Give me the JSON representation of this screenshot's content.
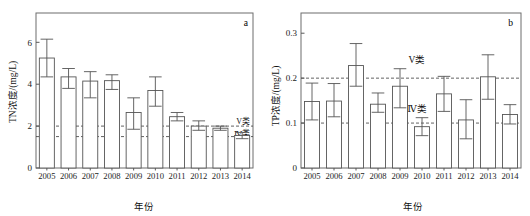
{
  "figure": {
    "panel_a_letter": "a",
    "panel_b_letter": "b"
  },
  "chart_data": [
    {
      "type": "bar",
      "panel": "a",
      "title": "",
      "xlabel": "年份",
      "ylabel": "TN浓度/(mg/L)",
      "categories": [
        "2005",
        "2006",
        "2007",
        "2008",
        "2009",
        "2010",
        "2011",
        "2012",
        "2013",
        "2014"
      ],
      "values": [
        5.25,
        4.35,
        4.15,
        4.17,
        2.65,
        3.7,
        2.45,
        2.0,
        1.9,
        1.55
      ],
      "error_low": [
        4.35,
        3.8,
        3.35,
        3.75,
        1.85,
        2.95,
        2.25,
        1.8,
        1.8,
        1.4
      ],
      "error_high": [
        6.15,
        4.75,
        4.6,
        4.45,
        3.35,
        4.35,
        2.65,
        2.25,
        2.0,
        1.7
      ],
      "ylim": [
        0,
        7.4
      ],
      "yticks": [
        0,
        2,
        4,
        6
      ],
      "ytick_labels": [
        "0",
        "2",
        "4",
        "6"
      ],
      "grid": false,
      "reference_lines": [
        {
          "label": "V类",
          "value": 2.0
        },
        {
          "label": "Ⅳ类",
          "value": 1.5
        }
      ]
    },
    {
      "type": "bar",
      "panel": "b",
      "title": "",
      "xlabel": "年份",
      "ylabel": "TP浓度/(mg/L)",
      "categories": [
        "2005",
        "2006",
        "2007",
        "2008",
        "2009",
        "2010",
        "2011",
        "2012",
        "2013",
        "2014"
      ],
      "values": [
        0.148,
        0.149,
        0.228,
        0.142,
        0.182,
        0.092,
        0.165,
        0.107,
        0.203,
        0.119
      ],
      "error_low": [
        0.107,
        0.114,
        0.182,
        0.124,
        0.134,
        0.072,
        0.126,
        0.065,
        0.153,
        0.098
      ],
      "error_high": [
        0.189,
        0.188,
        0.277,
        0.167,
        0.221,
        0.112,
        0.204,
        0.152,
        0.252,
        0.141
      ],
      "ylim": [
        0,
        0.345
      ],
      "yticks": [
        0,
        0.1,
        0.2,
        0.3
      ],
      "ytick_labels": [
        "0",
        "0.1",
        "0.2",
        "0.3"
      ],
      "grid": false,
      "reference_lines": [
        {
          "label": "V类",
          "value": 0.2
        },
        {
          "label": "Ⅳ类",
          "value": 0.1
        }
      ]
    }
  ]
}
